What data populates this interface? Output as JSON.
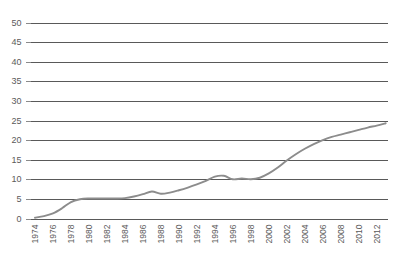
{
  "chart_data": {
    "type": "line",
    "title": "",
    "subtitle": "",
    "xlabel": "",
    "ylabel": "",
    "xlim": [
      1973.5,
      2013.2
    ],
    "ylim": [
      0,
      50
    ],
    "grid": true,
    "legend": null,
    "legend_position": "none",
    "y_ticks": [
      0,
      5,
      10,
      15,
      20,
      25,
      30,
      35,
      40,
      45,
      50
    ],
    "y_tick_labels": [
      "0",
      "5",
      "10",
      "15",
      "20",
      "25",
      "30",
      "35",
      "40",
      "45",
      "50"
    ],
    "x_ticks": [
      1974,
      1976,
      1978,
      1980,
      1982,
      1984,
      1986,
      1988,
      1990,
      1992,
      1994,
      1996,
      1998,
      2000,
      2002,
      2004,
      2006,
      2008,
      2010,
      2012
    ],
    "x_tick_labels": [
      "1974",
      "1976",
      "1978",
      "1980",
      "1982",
      "1984",
      "1986",
      "1988",
      "1990",
      "1992",
      "1994",
      "1996",
      "1998",
      "2000",
      "2002",
      "2004",
      "2006",
      "2008",
      "2010",
      "2012"
    ],
    "x_tick_rotation": 90,
    "series": [
      {
        "name": "series-1",
        "color": "#8c8c8c",
        "x": [
          1974,
          1975,
          1976,
          1977,
          1978,
          1979,
          1980,
          1981,
          1982,
          1983,
          1984,
          1985,
          1986,
          1987,
          1988,
          1989,
          1990,
          1991,
          1992,
          1993,
          1994,
          1995,
          1996,
          1997,
          1998,
          1999,
          2000,
          2001,
          2002,
          2003,
          2004,
          2005,
          2006,
          2007,
          2008,
          2009,
          2010,
          2011,
          2012,
          2013
        ],
        "values": [
          0.2,
          0.6,
          1.3,
          2.6,
          4.2,
          4.9,
          5.1,
          5.1,
          5.1,
          5.1,
          5.2,
          5.6,
          6.2,
          6.9,
          6.3,
          6.6,
          7.2,
          7.9,
          8.7,
          9.6,
          10.7,
          10.9,
          10.0,
          10.2,
          10.0,
          10.4,
          11.5,
          13.0,
          14.8,
          16.4,
          17.8,
          19.0,
          20.0,
          20.8,
          21.4,
          22.0,
          22.6,
          23.2,
          23.7,
          24.3
        ]
      }
    ]
  },
  "colors": {
    "line": "#8c8c8c",
    "grid": "#595959",
    "axis": "#595959",
    "tick_text": "#5a5a5a",
    "background": "#ffffff"
  }
}
